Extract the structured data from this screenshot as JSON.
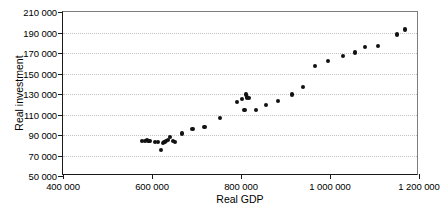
{
  "chart_data": {
    "type": "scatter",
    "title": "",
    "xlabel": "Real GDP",
    "ylabel": "Real investment",
    "xlim": [
      400000,
      1200000
    ],
    "ylim": [
      50000,
      210000
    ],
    "xticks": [
      400000,
      600000,
      800000,
      1000000,
      1200000
    ],
    "yticks": [
      50000,
      70000,
      90000,
      110000,
      130000,
      150000,
      170000,
      190000,
      210000
    ],
    "xtick_labels": [
      "400 000",
      "600 000",
      "800 000",
      "1 000 000",
      "1 200 000"
    ],
    "ytick_labels": [
      "50 000",
      "70 000",
      "90 000",
      "110 000",
      "130 000",
      "150 000",
      "170 000",
      "190 000",
      "210 000"
    ],
    "grid": "horizontal-dotted",
    "legend": null,
    "marker": "filled-circle",
    "marker_color": "#111111",
    "series": [
      {
        "name": "Real investment vs Real GDP",
        "points": [
          [
            578000,
            84000
          ],
          [
            584000,
            84500
          ],
          [
            588000,
            85500
          ],
          [
            592000,
            84500
          ],
          [
            596000,
            84000
          ],
          [
            607000,
            83500
          ],
          [
            613000,
            83000
          ],
          [
            620000,
            75500
          ],
          [
            624000,
            82500
          ],
          [
            628000,
            83500
          ],
          [
            631000,
            84000
          ],
          [
            636000,
            85500
          ],
          [
            641000,
            88000
          ],
          [
            648000,
            84500
          ],
          [
            652000,
            83500
          ],
          [
            667000,
            91500
          ],
          [
            691000,
            96000
          ],
          [
            718000,
            97500
          ],
          [
            752000,
            106500
          ],
          [
            791000,
            122500
          ],
          [
            803000,
            125500
          ],
          [
            808000,
            114500
          ],
          [
            812000,
            129500
          ],
          [
            814000,
            126500
          ],
          [
            818000,
            126000
          ],
          [
            833000,
            114500
          ],
          [
            857000,
            119500
          ],
          [
            884000,
            123000
          ],
          [
            915000,
            129500
          ],
          [
            940000,
            137000
          ],
          [
            967000,
            157000
          ],
          [
            996000,
            162500
          ],
          [
            1029000,
            167000
          ],
          [
            1056000,
            170500
          ],
          [
            1079000,
            176000
          ],
          [
            1107000,
            177000
          ],
          [
            1151000,
            188000
          ],
          [
            1168000,
            193000
          ]
        ]
      }
    ]
  }
}
